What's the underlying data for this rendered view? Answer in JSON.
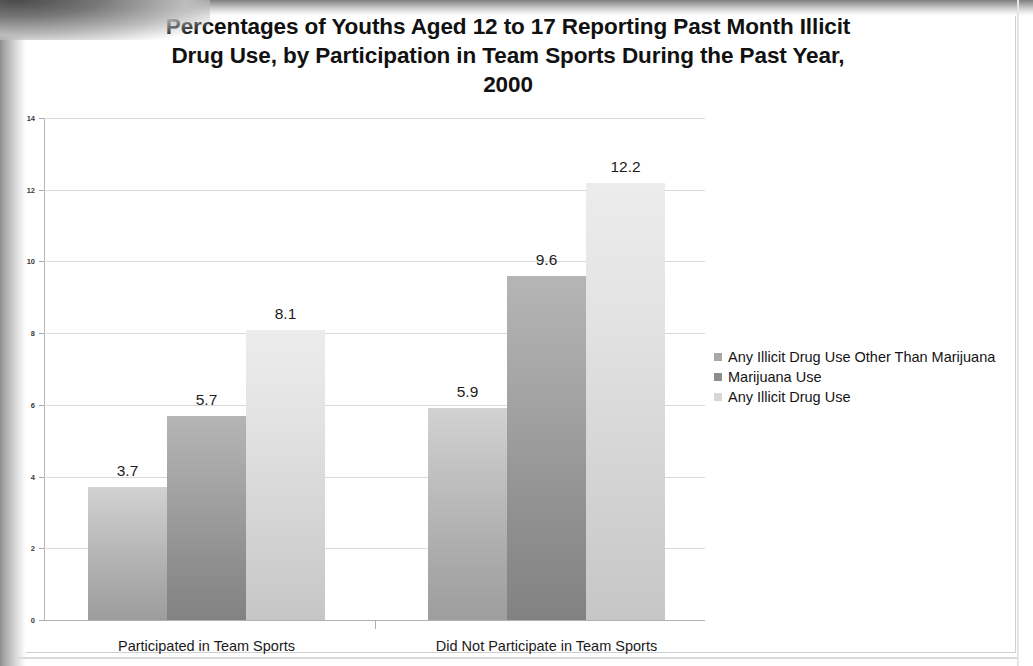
{
  "document": {
    "type": "scanned-chart-page"
  },
  "chart_data": {
    "type": "bar",
    "title": "Percentages of Youths Aged 12 to 17 Reporting Past Month Illicit Drug Use, by Participation in Team Sports During the Past Year, 2000",
    "title_lines": [
      "Percentages of Youths Aged 12 to 17 Reporting Past Month Illicit",
      "Drug Use, by Participation in Team Sports During the Past Year,",
      "2000"
    ],
    "subtitle": "",
    "xlabel": "",
    "ylabel": "",
    "categories": [
      "Participated in Team Sports",
      "Did Not Participate in Team Sports"
    ],
    "series": [
      {
        "name": "Any Illicit Drug Use Other Than Marijuana",
        "color": "#a8a8a8",
        "values": [
          3.7,
          5.9
        ],
        "labels": [
          "3.7",
          "5.9"
        ]
      },
      {
        "name": "Marijuana Use",
        "color": "#8e8e8e",
        "values": [
          5.7,
          9.6
        ],
        "labels": [
          "5.7",
          "9.6"
        ]
      },
      {
        "name": "Any Illicit Drug Use",
        "color": "#d7d7d7",
        "values": [
          8.1,
          12.2
        ],
        "labels": [
          "8.1",
          "12.2"
        ]
      }
    ],
    "ylim": [
      0,
      14
    ],
    "ytick_step": 2,
    "yticks": [
      "0",
      "2",
      "4",
      "6",
      "8",
      "10",
      "12",
      "14"
    ],
    "grid": true,
    "grid_axis": "y",
    "legend_position": "right",
    "value_labels_shown": true,
    "units": "percent"
  },
  "legend": {
    "entries": [
      "Any Illicit Drug Use Other Than Marijuana",
      "Marijuana Use",
      "Any Illicit Drug Use"
    ]
  }
}
